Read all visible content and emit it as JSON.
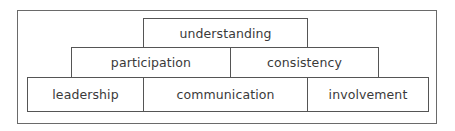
{
  "diagram": {
    "type": "pyramid",
    "levels": [
      {
        "row": "top",
        "items": [
          {
            "label": "understanding"
          }
        ]
      },
      {
        "row": "middle",
        "items": [
          {
            "label": "participation"
          },
          {
            "label": "consistency"
          }
        ]
      },
      {
        "row": "bottom",
        "items": [
          {
            "label": "leadership"
          },
          {
            "label": "communication"
          },
          {
            "label": "involvement"
          }
        ]
      }
    ]
  },
  "colors": {
    "border": "#555555",
    "text": "#3a3a3a",
    "frame": "#6a6a6a",
    "background": "#ffffff"
  }
}
